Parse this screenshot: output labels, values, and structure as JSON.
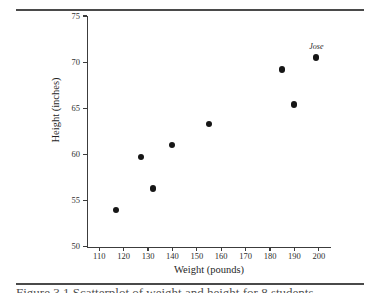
{
  "figure": {
    "caption_sliver": "Figure 3.1  Scatterplot of weight and height for 8 students"
  },
  "chart_data": {
    "type": "scatter",
    "title": "",
    "xlabel": "Weight (pounds)",
    "ylabel": "Height (inches)",
    "xlim": [
      105,
      205
    ],
    "ylim": [
      50,
      75
    ],
    "xticks": [
      110,
      120,
      130,
      140,
      150,
      160,
      170,
      180,
      190,
      200
    ],
    "yticks": [
      50,
      55,
      60,
      65,
      70,
      75
    ],
    "grid": false,
    "legend": "none",
    "marker": "filled-circle",
    "marker_color": "#161616",
    "points": [
      {
        "x": 117,
        "y": 54.0,
        "label": ""
      },
      {
        "x": 127,
        "y": 59.7,
        "label": ""
      },
      {
        "x": 132,
        "y": 56.3,
        "label": ""
      },
      {
        "x": 140,
        "y": 61.0,
        "label": ""
      },
      {
        "x": 155,
        "y": 63.3,
        "label": ""
      },
      {
        "x": 185,
        "y": 69.2,
        "label": ""
      },
      {
        "x": 190,
        "y": 65.4,
        "label": ""
      },
      {
        "x": 199,
        "y": 70.5,
        "label": "Jose"
      }
    ]
  }
}
